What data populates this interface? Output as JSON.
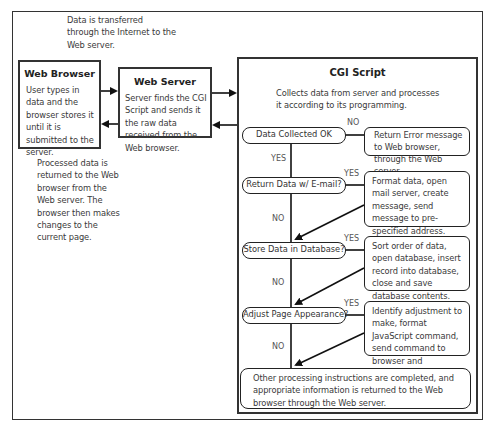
{
  "top_note": "Data is transferred through the Internet to the Web server.",
  "web_browser": {
    "title": "Web Browser",
    "body": "User types in data and the browser stores it until it is submitted to the server."
  },
  "web_server": {
    "title": "Web Server",
    "body": "Server finds the CGI Script and sends it the raw data received from the Web browser."
  },
  "return_note": "Processed data is returned to the Web browser from the Web server. The browser then makes changes to the current page.",
  "cgi_script": {
    "title": "CGI Script",
    "intro": "Collects data from server and processes it according to its programming.",
    "decisions": [
      {
        "label": "Data Collected OK",
        "branch_right": "NO",
        "branch_down": "YES",
        "action": "Return Error message to Web browser, through the Web server."
      },
      {
        "label": "Return Data w/ E-mail?",
        "branch_right": "YES",
        "branch_down": "NO",
        "action": "Format data, open mail server, create message, send message to pre-specified address."
      },
      {
        "label": "Store Data in Database?",
        "branch_right": "YES",
        "branch_down": "NO",
        "action": "Sort order of data, open database, insert record into database, close and save database contents."
      },
      {
        "label": "Adjust Page Appearance?",
        "branch_right": "YES",
        "branch_down": "NO",
        "action": "Identify adjustment to make, format JavaScript command, send command to browser and implement."
      }
    ],
    "final": "Other processing instructions are completed, and appropriate information is returned to the Web browser through the Web server."
  }
}
